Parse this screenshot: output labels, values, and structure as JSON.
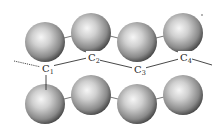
{
  "diagram": {
    "type": "molecular-structure",
    "colors": {
      "background": "#ffffff",
      "bond": "#333333",
      "sphere_light": "#f4f4f4",
      "sphere_mid": "#a8a8a8",
      "sphere_dark": "#3a3a3a",
      "label": "#222222"
    },
    "carbons": [
      {
        "id": "C1",
        "symbol": "C",
        "sub": "1",
        "x": 47,
        "y": 70
      },
      {
        "id": "C2",
        "symbol": "C",
        "sub": "2",
        "x": 93,
        "y": 59
      },
      {
        "id": "C3",
        "symbol": "C",
        "sub": "3",
        "x": 139,
        "y": 71
      },
      {
        "id": "C4",
        "symbol": "C",
        "sub": "4",
        "x": 185,
        "y": 59
      }
    ],
    "spheres_top": [
      {
        "x": 45,
        "y": 42,
        "r": 20
      },
      {
        "x": 91,
        "y": 33,
        "r": 20
      },
      {
        "x": 137,
        "y": 42,
        "r": 20
      },
      {
        "x": 183,
        "y": 33,
        "r": 20
      }
    ],
    "spheres_bottom": [
      {
        "x": 45,
        "y": 104,
        "r": 20
      },
      {
        "x": 91,
        "y": 95,
        "r": 20
      },
      {
        "x": 137,
        "y": 104,
        "r": 20
      },
      {
        "x": 183,
        "y": 95,
        "r": 20
      }
    ]
  }
}
